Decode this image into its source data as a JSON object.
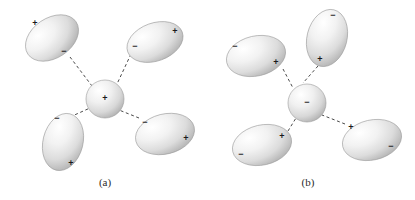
{
  "figure": {
    "background_color": "#ffffff",
    "body_fill_light": "#ffffff",
    "body_fill_mid": "#e3e3e3",
    "body_fill_dark": "#b4b4b4",
    "body_stroke": "#9a9a9a",
    "bond_color": "#4a4a4a",
    "sign_color": "#1a1a1a",
    "sign_plus": "+",
    "sign_minus": "−"
  },
  "panels": [
    {
      "id": "panel-a",
      "caption": "(a)",
      "caption_x": 105,
      "caption_y": 186,
      "center": {
        "name": "central-ion-a",
        "shape": "sphere",
        "cx": 105,
        "cy": 99,
        "rx": 19,
        "ry": 19,
        "rotation": 0,
        "sign": "+",
        "sign_x": 105,
        "sign_y": 99
      },
      "molecules": [
        {
          "name": "dipole-upper-left-a",
          "cx": 52,
          "cy": 38,
          "rx": 29,
          "ry": 20,
          "rotation": -34,
          "signs": [
            {
              "label": "+",
              "x": 35,
              "y": 24
            },
            {
              "label": "−",
              "x": 64,
              "y": 52
            }
          ],
          "bond": {
            "x1": 70,
            "y1": 57,
            "x2": 92,
            "y2": 86
          }
        },
        {
          "name": "dipole-upper-right-a",
          "cx": 155,
          "cy": 42,
          "rx": 29,
          "ry": 19,
          "rotation": -20,
          "signs": [
            {
              "label": "+",
              "x": 175,
              "y": 32
            },
            {
              "label": "−",
              "x": 135,
              "y": 47
            }
          ],
          "bond": {
            "x1": 131,
            "y1": 54,
            "x2": 117,
            "y2": 84
          }
        },
        {
          "name": "dipole-lower-left-a",
          "cx": 63,
          "cy": 142,
          "rx": 20,
          "ry": 29,
          "rotation": 14,
          "signs": [
            {
              "label": "−",
              "x": 57,
              "y": 119
            },
            {
              "label": "+",
              "x": 71,
              "y": 164
            }
          ],
          "bond": {
            "x1": 70,
            "y1": 117,
            "x2": 90,
            "y2": 108
          }
        },
        {
          "name": "dipole-lower-right-a",
          "cx": 165,
          "cy": 134,
          "rx": 30,
          "ry": 20,
          "rotation": -14,
          "signs": [
            {
              "label": "−",
              "x": 145,
              "y": 123
            },
            {
              "label": "+",
              "x": 186,
              "y": 139
            }
          ],
          "bond": {
            "x1": 139,
            "y1": 118,
            "x2": 119,
            "y2": 110
          }
        }
      ]
    },
    {
      "id": "panel-b",
      "caption": "(b)",
      "caption_x": 308,
      "caption_y": 186,
      "center": {
        "name": "central-ion-b",
        "shape": "sphere",
        "cx": 307,
        "cy": 103,
        "rx": 19,
        "ry": 19,
        "rotation": 0,
        "sign": "−",
        "sign_x": 307,
        "sign_y": 103
      },
      "molecules": [
        {
          "name": "dipole-top-b",
          "cx": 327,
          "cy": 38,
          "rx": 20,
          "ry": 29,
          "rotation": 14,
          "signs": [
            {
              "label": "−",
              "x": 333,
              "y": 16
            },
            {
              "label": "+",
              "x": 320,
              "y": 60
            }
          ],
          "bond": {
            "x1": 318,
            "y1": 66,
            "x2": 303,
            "y2": 83
          }
        },
        {
          "name": "dipole-upper-left-b",
          "cx": 256,
          "cy": 56,
          "rx": 30,
          "ry": 20,
          "rotation": -13,
          "signs": [
            {
              "label": "−",
              "x": 235,
              "y": 47
            },
            {
              "label": "+",
              "x": 276,
              "y": 63
            }
          ],
          "bond": {
            "x1": 283,
            "y1": 69,
            "x2": 293,
            "y2": 88
          }
        },
        {
          "name": "dipole-lower-left-b",
          "cx": 262,
          "cy": 145,
          "rx": 30,
          "ry": 20,
          "rotation": -13,
          "signs": [
            {
              "label": "+",
              "x": 282,
              "y": 137
            },
            {
              "label": "−",
              "x": 241,
              "y": 155
            }
          ],
          "bond": {
            "x1": 288,
            "y1": 131,
            "x2": 296,
            "y2": 118
          }
        },
        {
          "name": "dipole-lower-right-b",
          "cx": 372,
          "cy": 140,
          "rx": 30,
          "ry": 20,
          "rotation": -13,
          "signs": [
            {
              "label": "+",
              "x": 351,
              "y": 128
            },
            {
              "label": "−",
              "x": 391,
              "y": 147
            }
          ],
          "bond": {
            "x1": 345,
            "y1": 124,
            "x2": 322,
            "y2": 115
          }
        }
      ]
    }
  ]
}
